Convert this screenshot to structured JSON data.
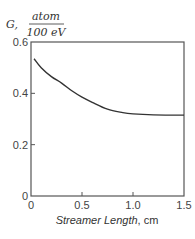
{
  "chart_data": {
    "type": "line",
    "title": "",
    "ylabel": "G, atom / 100 eV",
    "ylabel_prefix": "G,",
    "ylabel_numerator": "atom",
    "ylabel_denominator": "100 eV",
    "xlabel": "Streamer Length, cm",
    "xlabel_main": "Streamer Length",
    "xlabel_unit": ", cm",
    "xlim": [
      0,
      1.5
    ],
    "ylim": [
      0,
      0.6
    ],
    "xticks": [
      0,
      0.5,
      1.0,
      1.5
    ],
    "xtick_labels": [
      "0",
      "0.5",
      "1.0",
      "1.5"
    ],
    "yticks": [
      0,
      0.2,
      0.4,
      0.6
    ],
    "ytick_labels": [
      "0",
      "0.2",
      "0.4",
      "0.6"
    ],
    "grid": false,
    "legend": null,
    "series": [
      {
        "name": "G",
        "x": [
          0.03,
          0.1,
          0.2,
          0.3,
          0.4,
          0.5,
          0.6,
          0.75,
          0.9,
          1.0,
          1.2,
          1.5
        ],
        "y": [
          0.535,
          0.5,
          0.465,
          0.44,
          0.41,
          0.385,
          0.365,
          0.338,
          0.325,
          0.32,
          0.316,
          0.315
        ]
      }
    ],
    "colors": {
      "line": "#333333",
      "axes": "#555555"
    }
  }
}
